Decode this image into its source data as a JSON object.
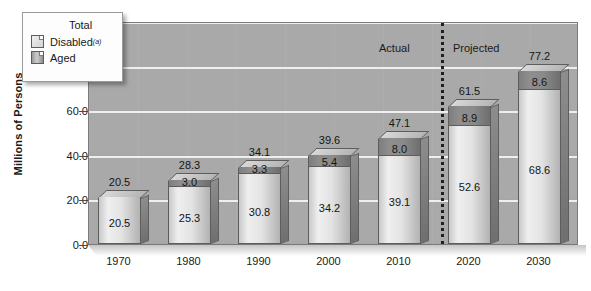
{
  "chart_data": {
    "type": "bar",
    "title": "",
    "xlabel": "",
    "ylabel": "Millions of Persons",
    "ylim": [
      0,
      100
    ],
    "ytick_labels": [
      "0.0",
      "20.0",
      "40.0",
      "60.0",
      "80.0",
      "100.0"
    ],
    "ytick_values": [
      0,
      20,
      40,
      60,
      80,
      100
    ],
    "grid": true,
    "stacked": true,
    "legend_position": "top-left",
    "categories": [
      "1970",
      "1980",
      "1990",
      "2000",
      "2010",
      "2020",
      "2030"
    ],
    "series": [
      {
        "name": "Aged",
        "values": [
          20.5,
          25.3,
          30.8,
          34.2,
          39.1,
          52.6,
          68.6
        ]
      },
      {
        "name": "Disabled",
        "values": [
          0,
          3.0,
          3.3,
          5.4,
          8.0,
          8.9,
          8.6
        ]
      }
    ],
    "totals": [
      20.5,
      28.3,
      34.1,
      39.6,
      47.1,
      61.5,
      77.2
    ],
    "annotations": [
      "Actual",
      "Projected"
    ],
    "divider_between": [
      "2010",
      "2020"
    ]
  },
  "legend": {
    "title": "Total",
    "items": [
      {
        "label": "Disabled",
        "superscript": "(a)",
        "swatch": "light-swatch"
      },
      {
        "label": "Aged",
        "superscript": "",
        "swatch": "dark-swatch"
      }
    ]
  },
  "axis": {
    "y_title": "Millions of Persons",
    "y_ticks": [
      "100.0",
      "80.0",
      "60.0",
      "40.0",
      "20.0",
      "0.0"
    ],
    "x_ticks": [
      "1970",
      "1980",
      "1990",
      "2000",
      "2010",
      "2020",
      "2030"
    ]
  },
  "phases": {
    "actual_label": "Actual",
    "projected_label": "Projected"
  },
  "bars": [
    {
      "year": "1970",
      "total": "20.5",
      "aged": "20.5",
      "disabled": ""
    },
    {
      "year": "1980",
      "total": "28.3",
      "aged": "25.3",
      "disabled": "3.0"
    },
    {
      "year": "1990",
      "total": "34.1",
      "aged": "30.8",
      "disabled": "3.3"
    },
    {
      "year": "2000",
      "total": "39.6",
      "aged": "34.2",
      "disabled": "5.4"
    },
    {
      "year": "2010",
      "total": "47.1",
      "aged": "39.1",
      "disabled": "8.0"
    },
    {
      "year": "2020",
      "total": "61.5",
      "aged": "52.6",
      "disabled": "8.9"
    },
    {
      "year": "2030",
      "total": "77.2",
      "aged": "68.6",
      "disabled": "8.6"
    }
  ],
  "colors": {
    "plot_background": "#a9a9a9",
    "gridline": "#f2f2f2",
    "aged_fill": "#e3e3e3",
    "disabled_fill": "#8a8a8a",
    "text": "#1a1a1a",
    "divider": "#1f1f1f"
  }
}
